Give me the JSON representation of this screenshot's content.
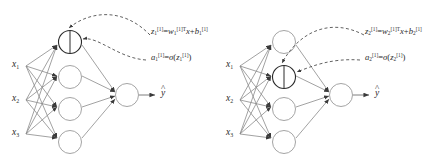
{
  "figure": {
    "kind": "neural-network-diagram",
    "background_color": "#ffffff",
    "panel_count": 2,
    "colors": {
      "edge": "#8a8a8a",
      "node_stroke": "#9a9a9a",
      "highlight_stroke": "#2a2a2a",
      "dashed_annotation": "#3a3a3a",
      "text": "#2b2b2b"
    }
  },
  "panels": [
    {
      "id": "left",
      "highlighted_unit_index": 1,
      "inputs": [
        {
          "label_main": "x",
          "label_sub": "1"
        },
        {
          "label_main": "x",
          "label_sub": "2"
        },
        {
          "label_main": "x",
          "label_sub": "3"
        }
      ],
      "hidden_units": 4,
      "output_label": {
        "base": "y",
        "accent": "^"
      },
      "annotations": [
        {
          "name": "pre-activation-equation",
          "target": "left-half-of-highlighted-unit",
          "lhs_main": "z",
          "lhs_sub": "1",
          "lhs_sup": "[1]",
          "eq": "=",
          "w_main": "w",
          "w_sub": "1",
          "w_sup": "[1]T",
          "x_main": "x",
          "plus": "+",
          "b_main": "b",
          "b_sub": "1",
          "b_sup": "[1]"
        },
        {
          "name": "activation-equation",
          "target": "right-half-of-highlighted-unit",
          "lhs_main": "a",
          "lhs_sub": "1",
          "lhs_sup": "[1]",
          "eq": "=",
          "sigma": "σ",
          "open": "(",
          "arg_main": "z",
          "arg_sub": "1",
          "arg_sup": "[1]",
          "close": ")"
        }
      ]
    },
    {
      "id": "right",
      "highlighted_unit_index": 2,
      "inputs": [
        {
          "label_main": "x",
          "label_sub": "1"
        },
        {
          "label_main": "x",
          "label_sub": "2"
        },
        {
          "label_main": "x",
          "label_sub": "3"
        }
      ],
      "hidden_units": 4,
      "output_label": {
        "base": "y",
        "accent": "^"
      },
      "annotations": [
        {
          "name": "pre-activation-equation",
          "target": "left-half-of-highlighted-unit",
          "lhs_main": "z",
          "lhs_sub": "2",
          "lhs_sup": "[1]",
          "eq": "=",
          "w_main": "w",
          "w_sub": "2",
          "w_sup": "[1]T",
          "x_main": "x",
          "plus": "+",
          "b_main": "b",
          "b_sub": "2",
          "b_sup": "[1]"
        },
        {
          "name": "activation-equation",
          "target": "right-half-of-highlighted-unit",
          "lhs_main": "a",
          "lhs_sub": "2",
          "lhs_sup": "[1]",
          "eq": "=",
          "sigma": "σ",
          "open": "(",
          "arg_main": "z",
          "arg_sub": "2",
          "arg_sup": "[1]",
          "close": ")"
        }
      ]
    }
  ]
}
